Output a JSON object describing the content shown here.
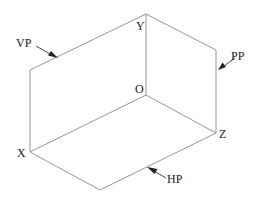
{
  "diagram": {
    "axes": {
      "x": "X",
      "y": "Y",
      "z": "Z",
      "origin": "O"
    },
    "planes": [
      {
        "id": "vp",
        "label": "VP"
      },
      {
        "id": "pp",
        "label": "PP"
      },
      {
        "id": "hp",
        "label": "HP"
      }
    ],
    "colors": {
      "edges": "#8a8a8a",
      "text": "#222222",
      "background": "#ffffff"
    }
  }
}
